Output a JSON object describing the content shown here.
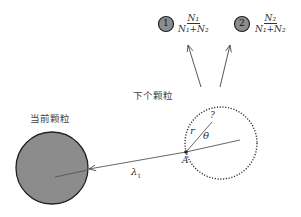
{
  "labels": {
    "current_particle": "当前颗粒",
    "next_particle": "下个颗粒",
    "point_a": "A",
    "radius": "r",
    "angle": "θ",
    "unknown": "?",
    "path_length": "λ",
    "path_length_sub": "1"
  },
  "outcomes": [
    {
      "id": "1",
      "numerator": "N₁",
      "denominator": "N₁+N₂"
    },
    {
      "id": "2",
      "numerator": "N₂",
      "denominator": "N₁+N₂"
    }
  ],
  "colors": {
    "particle_fill": "#8c8c8c",
    "line": "#555555",
    "stroke": "#222222"
  }
}
